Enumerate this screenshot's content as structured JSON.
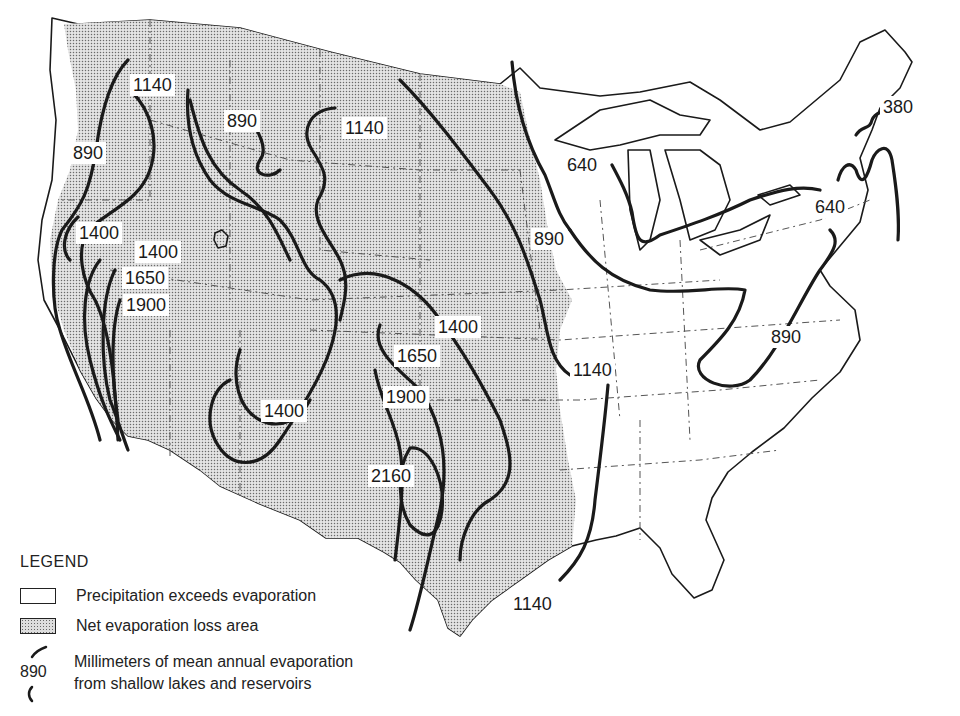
{
  "map": {
    "subject": "Mean annual evaporation from shallow lakes and reservoirs, conterminous United States",
    "colors": {
      "net_loss_fill": "#d9d9d9",
      "background": "#ffffff",
      "contour": "#1a1a1a"
    },
    "contour_labels": [
      {
        "id": "nw-1140",
        "value": "1140",
        "x": 130,
        "y": 74
      },
      {
        "id": "nw-890-coast",
        "value": "890",
        "x": 72,
        "y": 142
      },
      {
        "id": "mt-890",
        "value": "890",
        "x": 224,
        "y": 110
      },
      {
        "id": "nd-1140",
        "value": "1140",
        "x": 342,
        "y": 117
      },
      {
        "id": "ca-1400-a",
        "value": "1400",
        "x": 76,
        "y": 222
      },
      {
        "id": "ca-1400-b",
        "value": "1400",
        "x": 135,
        "y": 241
      },
      {
        "id": "ca-1650",
        "value": "1650",
        "x": 122,
        "y": 267
      },
      {
        "id": "ca-1900",
        "value": "1900",
        "x": 123,
        "y": 294
      },
      {
        "id": "plains-890",
        "value": "890",
        "x": 531,
        "y": 228
      },
      {
        "id": "ks-1400",
        "value": "1400",
        "x": 435,
        "y": 316
      },
      {
        "id": "tx-1650",
        "value": "1650",
        "x": 394,
        "y": 345
      },
      {
        "id": "ar-1140",
        "value": "1140",
        "x": 570,
        "y": 359
      },
      {
        "id": "az-1400",
        "value": "1400",
        "x": 261,
        "y": 400
      },
      {
        "id": "tx-1900",
        "value": "1900",
        "x": 383,
        "y": 386
      },
      {
        "id": "tx-2160",
        "value": "2160",
        "x": 368,
        "y": 465
      },
      {
        "id": "gulf-1140",
        "value": "1140",
        "x": 510,
        "y": 593
      },
      {
        "id": "mn-640",
        "value": "640",
        "x": 564,
        "y": 154
      },
      {
        "id": "ny-640",
        "value": "640",
        "x": 812,
        "y": 196
      },
      {
        "id": "me-380",
        "value": "380",
        "x": 880,
        "y": 96
      },
      {
        "id": "va-890",
        "value": "890",
        "x": 768,
        "y": 326
      }
    ]
  },
  "legend": {
    "title": "LEGEND",
    "items": [
      {
        "type": "white",
        "label": "Precipitation exceeds evaporation"
      },
      {
        "type": "dots",
        "label": "Net evaporation loss area"
      },
      {
        "type": "contour",
        "sample_value": "890",
        "label_line1": "Millimeters of mean annual evaporation",
        "label_line2": "from shallow lakes and reservoirs"
      }
    ]
  }
}
